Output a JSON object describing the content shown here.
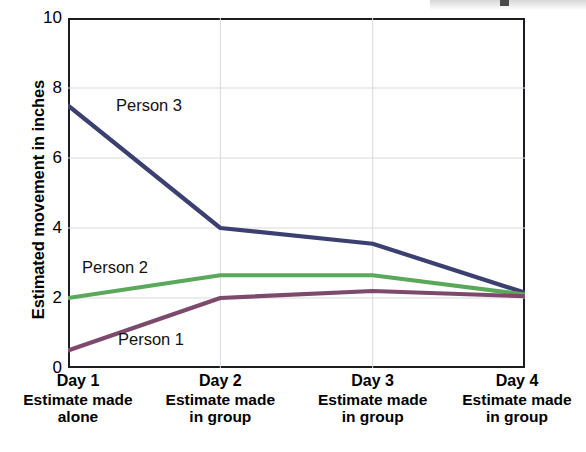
{
  "chart_data": {
    "type": "line",
    "title": "",
    "subtitle": "",
    "xlabel": "",
    "ylabel": "Estimated movement in inches",
    "categories": [
      "Day 1",
      "Day 2",
      "Day 3",
      "Day 4"
    ],
    "category_sublabels": [
      "Estimate made\nalone",
      "Estimate made\nin group",
      "Estimate made\nin group",
      "Estimate made\nin group"
    ],
    "x_tick_labels": [
      "Day 1",
      "Day 2",
      "Day 3",
      "Day 4"
    ],
    "y_tick_labels": [
      "0",
      "2",
      "4",
      "6",
      "8",
      "10"
    ],
    "y_ticks": [
      0,
      2,
      4,
      6,
      8,
      10
    ],
    "ylim": [
      0,
      10
    ],
    "grid": true,
    "legend": "inline-labels",
    "series": [
      {
        "name": "Person 3",
        "color": "#3c4070",
        "values": [
          7.5,
          4.0,
          3.55,
          2.15
        ],
        "label_position": "upper-left"
      },
      {
        "name": "Person 2",
        "color": "#5aa85a",
        "values": [
          2.0,
          2.65,
          2.65,
          2.1
        ],
        "label_position": "mid-left"
      },
      {
        "name": "Person 1",
        "color": "#7d4a6e",
        "values": [
          0.5,
          2.0,
          2.2,
          2.05
        ],
        "label_position": "lower-left"
      }
    ],
    "annotations": [
      {
        "text": "Person 3",
        "series": "Person 3"
      },
      {
        "text": "Person 2",
        "series": "Person 2"
      },
      {
        "text": "Person 1",
        "series": "Person 1"
      }
    ]
  },
  "axis": {
    "y_title": "Estimated movement in inches"
  }
}
